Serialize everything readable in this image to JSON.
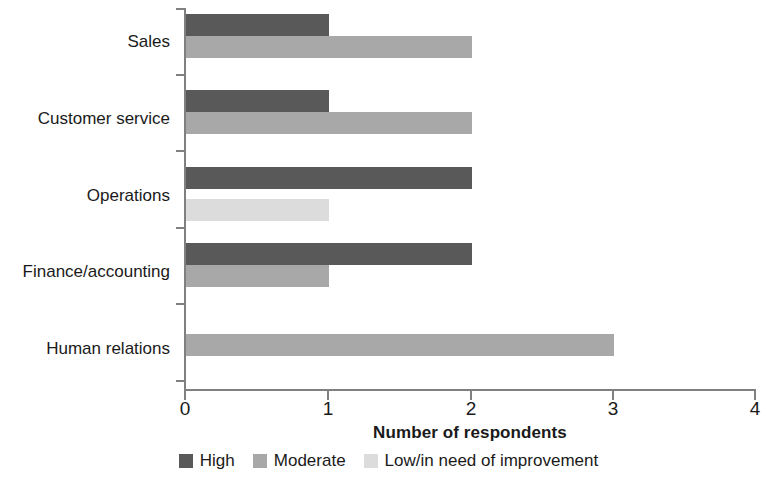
{
  "chart_data": {
    "type": "bar",
    "orientation": "horizontal",
    "title": "",
    "xlabel": "Number of respondents",
    "ylabel": "",
    "xlim": [
      0,
      4
    ],
    "xticks": [
      "0",
      "1",
      "2",
      "3",
      "4"
    ],
    "grid": false,
    "legend_position": "bottom",
    "categories": [
      "Sales",
      "Customer service",
      "Operations",
      "Finance/accounting",
      "Human relations"
    ],
    "series": [
      {
        "name": "High",
        "color": "#595959",
        "values": [
          1,
          1,
          2,
          2,
          0
        ]
      },
      {
        "name": "Moderate",
        "color": "#a8a8a8",
        "values": [
          2,
          2,
          0,
          1,
          3
        ]
      },
      {
        "name": "Low/in need of improvement",
        "color": "#dcdcdc",
        "values": [
          0,
          0,
          1,
          0,
          0
        ]
      }
    ]
  },
  "axis": {
    "x_title": "Number of respondents",
    "tick_labels": [
      "0",
      "1",
      "2",
      "3",
      "4"
    ]
  },
  "categories": {
    "c0": "Sales",
    "c1": "Customer service",
    "c2": "Operations",
    "c3": "Finance/accounting",
    "c4": "Human relations"
  },
  "legend": {
    "items": [
      {
        "label": "High",
        "color": "#595959"
      },
      {
        "label": "Moderate",
        "color": "#a8a8a8"
      },
      {
        "label": "Low/in need of improvement",
        "color": "#dcdcdc"
      }
    ]
  },
  "colors": {
    "high": "#595959",
    "moderate": "#a8a8a8",
    "low": "#dcdcdc",
    "axis": "#808080",
    "text": "#1a1a1a",
    "background": "#ffffff"
  }
}
